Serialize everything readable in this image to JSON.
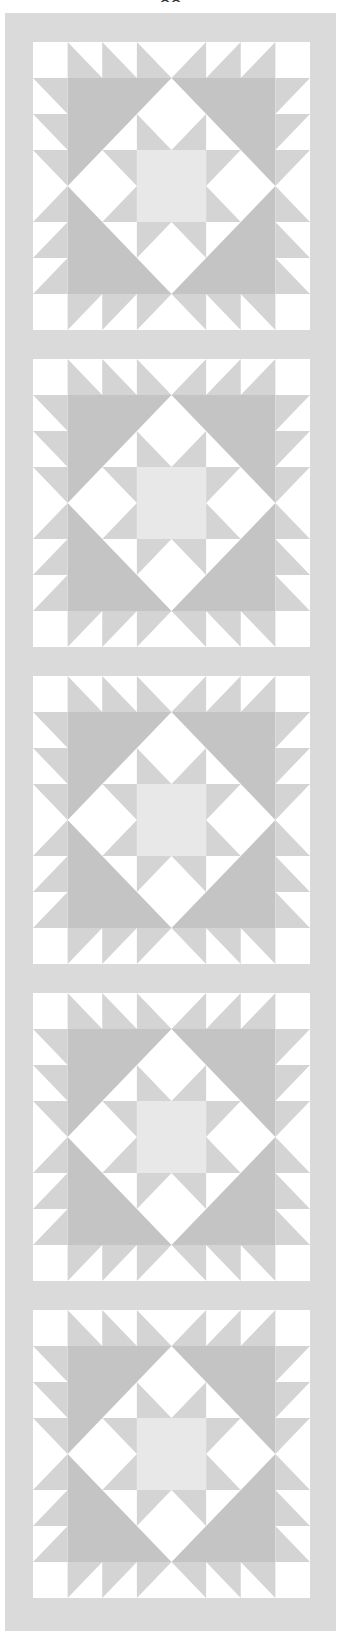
{
  "page": {
    "page_number": "88"
  },
  "quilt": {
    "name": "quilt-table-runner",
    "block_count": 5,
    "grid_units": 8,
    "colors": {
      "frame": "#dadada",
      "background": "#ffffff",
      "dark": "#c4c4c4",
      "medium": "#d4d4d4",
      "light_center": "#e8e8e8"
    }
  }
}
